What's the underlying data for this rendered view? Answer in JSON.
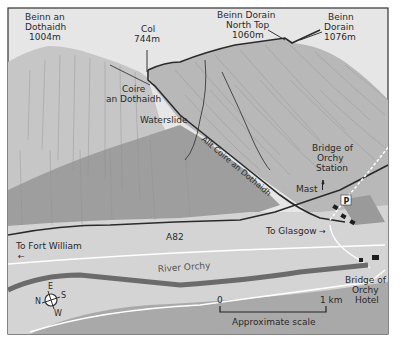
{
  "map": {
    "peaks": [
      {
        "name_line1": "Beinn an",
        "name_line2": "Dothaidh",
        "height": "1004m"
      },
      {
        "name_line1": "Col",
        "height": "744m"
      },
      {
        "name_line1": "Beinn Dorain",
        "name_line2": "North Top",
        "height": "1060m"
      },
      {
        "name_line1": "Beinn",
        "name_line2": "Dorain",
        "height": "1076m"
      }
    ],
    "features": {
      "coire_line1": "Coire",
      "coire_line2": "an Dothaidh",
      "waterslide": "Waterslide",
      "burn": "Allt Coire an Dothaidh",
      "station_line1": "Bridge of",
      "station_line2": "Orchy",
      "station_line3": "Station",
      "mast": "Mast",
      "parking": "P",
      "road": "A82",
      "to_fort_william": "To Fort William",
      "to_glasgow": "To Glasgow",
      "river": "River Orchy",
      "hotel_line1": "Bridge of",
      "hotel_line2": "Orchy",
      "hotel_line3": "Hotel"
    },
    "compass": {
      "n": "N",
      "e": "E",
      "s": "S",
      "w": "W"
    },
    "scale": {
      "start": "0",
      "end": "1 km",
      "caption": "Approximate scale"
    },
    "colors": {
      "sky": "#e6e6e6",
      "hill_light": "#c4c4c4",
      "hill_mid": "#b3b3b3",
      "hill_dark": "#9a9a9a",
      "valley": "#d2d2d2",
      "route": "#2b2b2b",
      "river": "#6f6f6f",
      "frame": "#333333"
    }
  }
}
